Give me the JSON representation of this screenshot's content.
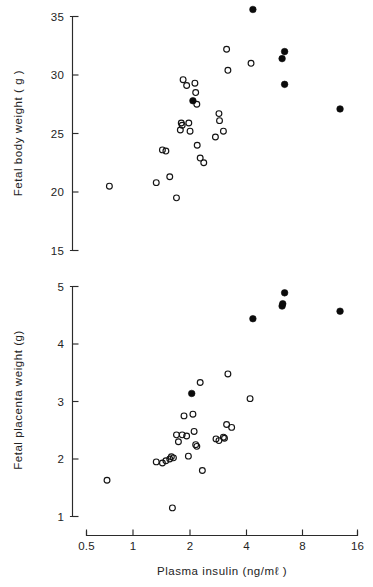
{
  "figure": {
    "kind": "scatter-figure",
    "panel_count": 2,
    "background_color": "#ffffff",
    "marker_colors": {
      "open": "#141414",
      "filled": "#0b0b0b"
    }
  },
  "axis": {
    "x_title": "Plasma insulin (ng/mℓ )",
    "x_ticks": [
      "0.5",
      "1",
      "2",
      "4",
      "8",
      "16"
    ],
    "x_tick_values": [
      0.5,
      1,
      2,
      4,
      8,
      16
    ],
    "top_y_title": "Fetal body weight ( g )",
    "top_y_ticks": [
      "35",
      "30",
      "25",
      "20",
      "15"
    ],
    "top_y_tick_values": [
      35,
      30,
      25,
      20,
      15
    ],
    "bottom_y_title": "Fetal placenta weight (g)",
    "bottom_y_ticks": [
      "5",
      "4",
      "3",
      "2",
      "1"
    ],
    "bottom_y_tick_values": [
      5,
      4,
      3,
      2,
      1
    ]
  },
  "chart_data": [
    {
      "type": "scatter",
      "title": "",
      "panel": "top",
      "xlabel": "Plasma insulin (ng/mℓ )",
      "ylabel": "Fetal body weight ( g )",
      "xscale": "log",
      "xlim": [
        0.5,
        16
      ],
      "ylim": [
        15,
        35
      ],
      "xticks": [
        0.5,
        1,
        2,
        4,
        8,
        16
      ],
      "yticks": [
        15,
        20,
        25,
        30,
        35
      ],
      "grid": false,
      "legend": false,
      "series": [
        {
          "name": "open circles",
          "marker": "open-circle",
          "points": [
            [
              0.67,
              20.5
            ],
            [
              1.22,
              20.8
            ],
            [
              1.32,
              23.6
            ],
            [
              1.38,
              23.5
            ],
            [
              1.45,
              21.3
            ],
            [
              1.58,
              19.5
            ],
            [
              1.66,
              25.3
            ],
            [
              1.68,
              25.9
            ],
            [
              1.7,
              25.7
            ],
            [
              1.72,
              29.6
            ],
            [
              1.8,
              29.1
            ],
            [
              1.85,
              25.9
            ],
            [
              1.88,
              25.2
            ],
            [
              2.0,
              29.3
            ],
            [
              2.02,
              28.5
            ],
            [
              2.05,
              27.5
            ],
            [
              2.06,
              24.0
            ],
            [
              2.14,
              22.9
            ],
            [
              2.24,
              22.5
            ],
            [
              2.6,
              24.7
            ],
            [
              2.72,
              26.7
            ],
            [
              2.74,
              26.1
            ],
            [
              2.88,
              25.2
            ],
            [
              3.0,
              32.2
            ],
            [
              3.05,
              30.4
            ],
            [
              4.1,
              31.0
            ]
          ]
        },
        {
          "name": "filled circles",
          "marker": "filled-circle",
          "points": [
            [
              1.95,
              27.8
            ],
            [
              4.2,
              35.6
            ],
            [
              6.1,
              31.4
            ],
            [
              6.3,
              32.0
            ],
            [
              6.3,
              29.2
            ],
            [
              12.8,
              27.1
            ]
          ]
        }
      ]
    },
    {
      "type": "scatter",
      "title": "",
      "panel": "bottom",
      "xlabel": "Plasma insulin (ng/mℓ )",
      "ylabel": "Fetal placenta weight (g)",
      "xscale": "log",
      "xlim": [
        0.5,
        16
      ],
      "ylim": [
        1,
        5
      ],
      "xticks": [
        0.5,
        1,
        2,
        4,
        8,
        16
      ],
      "yticks": [
        1,
        2,
        3,
        4,
        5
      ],
      "grid": false,
      "legend": false,
      "series": [
        {
          "name": "open circles",
          "marker": "open-circle",
          "points": [
            [
              0.65,
              1.63
            ],
            [
              1.22,
              1.95
            ],
            [
              1.32,
              1.93
            ],
            [
              1.38,
              1.97
            ],
            [
              1.45,
              2.0
            ],
            [
              1.48,
              2.04
            ],
            [
              1.5,
              1.15
            ],
            [
              1.52,
              2.02
            ],
            [
              1.58,
              2.42
            ],
            [
              1.62,
              2.3
            ],
            [
              1.7,
              2.42
            ],
            [
              1.74,
              2.75
            ],
            [
              1.8,
              2.4
            ],
            [
              1.84,
              2.05
            ],
            [
              1.95,
              2.78
            ],
            [
              1.98,
              2.48
            ],
            [
              2.02,
              2.25
            ],
            [
              2.05,
              2.22
            ],
            [
              2.14,
              3.33
            ],
            [
              2.2,
              1.8
            ],
            [
              2.62,
              2.35
            ],
            [
              2.72,
              2.32
            ],
            [
              2.88,
              2.38
            ],
            [
              2.92,
              2.36
            ],
            [
              3.0,
              2.6
            ],
            [
              3.05,
              3.48
            ],
            [
              3.2,
              2.55
            ],
            [
              4.05,
              3.05
            ]
          ]
        },
        {
          "name": "filled circles",
          "marker": "filled-circle",
          "points": [
            [
              1.92,
              3.14
            ],
            [
              4.2,
              4.44
            ],
            [
              6.1,
              4.66
            ],
            [
              6.15,
              4.7
            ],
            [
              6.3,
              4.89
            ],
            [
              12.8,
              4.57
            ]
          ]
        }
      ]
    }
  ]
}
